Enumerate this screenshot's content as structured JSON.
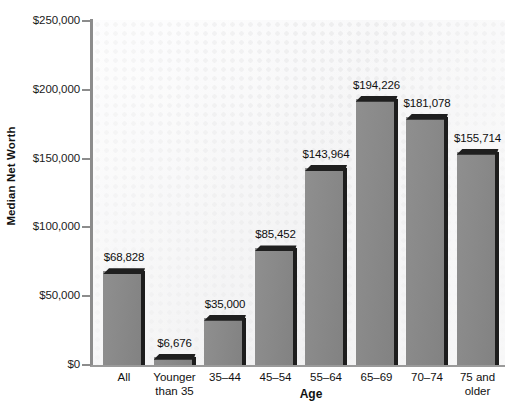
{
  "chart_data": {
    "type": "bar",
    "title": "",
    "xlabel": "Age",
    "ylabel": "Median Net Worth",
    "categories": [
      "All",
      "Younger\nthan 35",
      "35–44",
      "45–54",
      "55–64",
      "65–69",
      "70–74",
      "75 and\nolder"
    ],
    "values": [
      68828,
      6676,
      35000,
      85452,
      143964,
      194226,
      181078,
      155714
    ],
    "value_labels": [
      "$68,828",
      "$6,676",
      "$35,000",
      "$85,452",
      "$143,964",
      "$194,226",
      "$181,078",
      "$155,714"
    ],
    "ylim": [
      0,
      250000
    ],
    "ytick_values": [
      0,
      50000,
      100000,
      150000,
      200000,
      250000
    ],
    "ytick_labels": [
      "$0",
      "$50,000",
      "$100,000",
      "$150,000",
      "$200,000",
      "$250,000"
    ],
    "grid": false,
    "legend": "none",
    "bar_color": "#8a8a8a",
    "bar_edge_color": "#1d1d1d",
    "axis_color": "#8c8c8c",
    "text_color": "#111111",
    "plot_background": "#f2f2f3"
  }
}
